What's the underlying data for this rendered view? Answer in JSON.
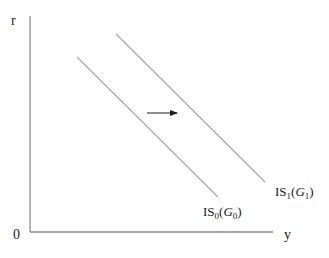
{
  "diagram": {
    "type": "IS curve shift",
    "axes": {
      "y_label": "r",
      "x_label": "y",
      "origin_label": "0",
      "color": "#8a8a8a"
    },
    "curves": [
      {
        "name": "IS0",
        "label_main": "IS",
        "label_sub": "0",
        "label_paren_var": "G",
        "label_paren_sub": "0",
        "x1": 77,
        "y1": 57,
        "x2": 218,
        "y2": 197,
        "color": "#a8a8a8"
      },
      {
        "name": "IS1",
        "label_main": "IS",
        "label_sub": "1",
        "label_paren_var": "G",
        "label_paren_sub": "1",
        "x1": 116,
        "y1": 34,
        "x2": 265,
        "y2": 182,
        "color": "#a8a8a8"
      }
    ],
    "shift_arrow": {
      "direction": "right",
      "x1": 147,
      "y1": 113,
      "x2": 177,
      "y2": 113,
      "color": "#1a1a1a"
    }
  }
}
